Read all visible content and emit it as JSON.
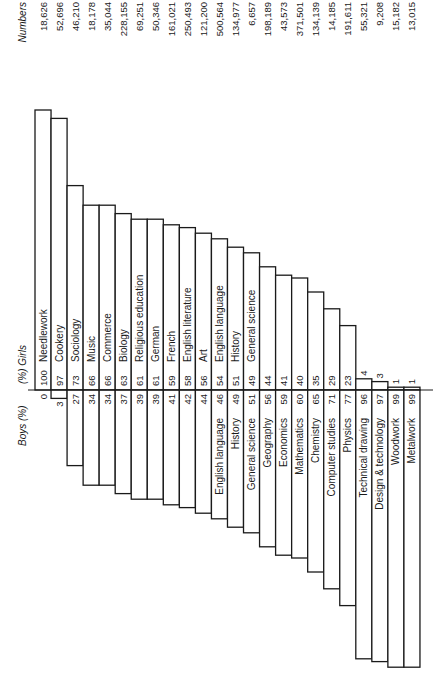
{
  "chart_data": {
    "type": "bar",
    "orientation": "rotated 90 degrees (diverging stacked columns; text reads bottom-to-top)",
    "title": "",
    "girls_axis_label": "(%) Girls",
    "boys_axis_label": "Boys (%)",
    "numbers_header": "Numbers",
    "ylim": [
      -100,
      100
    ],
    "categories": [
      "Needlework",
      "Cookery",
      "Sociology",
      "Music",
      "Commerce",
      "Biology",
      "Religious education",
      "German",
      "French",
      "English literature",
      "Art",
      "English language",
      "History",
      "General science",
      "Geography",
      "Economics",
      "Mathematics",
      "Chemistry",
      "Computer studies",
      "Physics",
      "Technical drawing",
      "Design & technology",
      "Woodwork",
      "Metalwork"
    ],
    "series": [
      {
        "name": "Girls (%)",
        "values": [
          100,
          97,
          73,
          66,
          66,
          63,
          61,
          61,
          59,
          58,
          56,
          54,
          51,
          49,
          44,
          41,
          40,
          35,
          29,
          23,
          4,
          3,
          1,
          1
        ]
      },
      {
        "name": "Boys (%)",
        "values": [
          0,
          3,
          27,
          34,
          34,
          37,
          39,
          39,
          41,
          42,
          44,
          46,
          49,
          51,
          56,
          59,
          60,
          65,
          71,
          77,
          96,
          97,
          99,
          99
        ]
      }
    ],
    "numbers": [
      "18,626",
      "52,696",
      "46,210",
      "18,178",
      "35,044",
      "228,155",
      "69,251",
      "50,346",
      "161,021",
      "250,493",
      "121,200",
      "500,564",
      "134,977",
      "6,657",
      "198,189",
      "43,573",
      "371,501",
      "134,139",
      "14,185",
      "191,611",
      "55,321",
      "9,208",
      "15,182",
      "13,015"
    ],
    "girls_labels_shown_for": [
      "Needlework",
      "Cookery",
      "Sociology",
      "Music",
      "Commerce",
      "Biology",
      "Religious education",
      "German",
      "French",
      "English literature",
      "Art",
      "English language",
      "History",
      "General science"
    ],
    "boys_labels_shown_for": [
      "English language",
      "History",
      "General science",
      "Geography",
      "Economics",
      "Mathematics",
      "Chemistry",
      "Computer studies",
      "Physics",
      "Technical drawing",
      "Design & technology",
      "Woodwork",
      "Metalwork"
    ],
    "legend": "none",
    "grid": false
  }
}
